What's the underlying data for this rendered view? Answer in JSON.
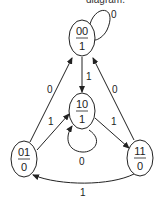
{
  "caption": "diagram.",
  "diagram": {
    "type": "state-diagram",
    "nodes": [
      {
        "id": "s00",
        "state": "00",
        "output": "1"
      },
      {
        "id": "s10",
        "state": "10",
        "output": "1"
      },
      {
        "id": "s01",
        "state": "01",
        "output": "0"
      },
      {
        "id": "s11",
        "state": "11",
        "output": "0"
      }
    ],
    "edges": [
      {
        "from": "s00",
        "to": "s00",
        "label": "0"
      },
      {
        "from": "s00",
        "to": "s10",
        "label": "1"
      },
      {
        "from": "s01",
        "to": "s00",
        "label": "0"
      },
      {
        "from": "s11",
        "to": "s00",
        "label": "0"
      },
      {
        "from": "s01",
        "to": "s10",
        "label": "1"
      },
      {
        "from": "s10",
        "to": "s10",
        "label": "0"
      },
      {
        "from": "s10",
        "to": "s11",
        "label": "1"
      },
      {
        "from": "s11",
        "to": "s01",
        "label": "1"
      }
    ]
  }
}
